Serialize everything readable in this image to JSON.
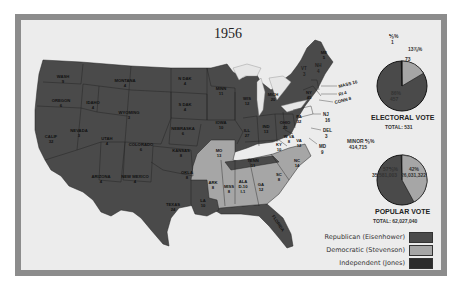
{
  "title": "1956",
  "colors": {
    "republican": "#4a4a4a",
    "democratic": "#a6a6a6",
    "independent": "#2b2b2b",
    "frame": "#8c8c8c",
    "paper": "#ececec"
  },
  "states": [
    {
      "name": "WASH",
      "ev": "9",
      "party": "R"
    },
    {
      "name": "OREGON",
      "ev": "6",
      "party": "R"
    },
    {
      "name": "CALIF",
      "ev": "32",
      "party": "R"
    },
    {
      "name": "IDAHO",
      "ev": "4",
      "party": "R"
    },
    {
      "name": "NEVADA",
      "ev": "3",
      "party": "R"
    },
    {
      "name": "MONTANA",
      "ev": "4",
      "party": "R"
    },
    {
      "name": "WYOMING",
      "ev": "3",
      "party": "R"
    },
    {
      "name": "UTAH",
      "ev": "4",
      "party": "R"
    },
    {
      "name": "ARIZONA",
      "ev": "4",
      "party": "R"
    },
    {
      "name": "COLORADO",
      "ev": "6",
      "party": "R"
    },
    {
      "name": "NEW MEXICO",
      "ev": "4",
      "party": "R"
    },
    {
      "name": "N DAK",
      "ev": "4",
      "party": "R"
    },
    {
      "name": "S DAK",
      "ev": "4",
      "party": "R"
    },
    {
      "name": "NEBRASKA",
      "ev": "6",
      "party": "R"
    },
    {
      "name": "KANSAS",
      "ev": "8",
      "party": "R"
    },
    {
      "name": "OKLA",
      "ev": "8",
      "party": "R"
    },
    {
      "name": "TEXAS",
      "ev": "24",
      "party": "R"
    },
    {
      "name": "MINN",
      "ev": "11",
      "party": "R"
    },
    {
      "name": "IOWA",
      "ev": "10",
      "party": "R"
    },
    {
      "name": "MO",
      "ev": "13",
      "party": "D"
    },
    {
      "name": "ARK",
      "ev": "8",
      "party": "D"
    },
    {
      "name": "LA",
      "ev": "10",
      "party": "R"
    },
    {
      "name": "WIS",
      "ev": "12",
      "party": "R"
    },
    {
      "name": "ILL",
      "ev": "27",
      "party": "R"
    },
    {
      "name": "MICH",
      "ev": "20",
      "party": "R"
    },
    {
      "name": "IND",
      "ev": "13",
      "party": "R"
    },
    {
      "name": "OHIO",
      "ev": "25",
      "party": "R"
    },
    {
      "name": "KY",
      "ev": "10",
      "party": "R"
    },
    {
      "name": "TENN",
      "ev": "11",
      "party": "R"
    },
    {
      "name": "MISS",
      "ev": "8",
      "party": "D"
    },
    {
      "name": "ALA",
      "ev": "D-10 I-1",
      "party": "D"
    },
    {
      "name": "GA",
      "ev": "12",
      "party": "D"
    },
    {
      "name": "FLORIDA",
      "ev": "10",
      "party": "R"
    },
    {
      "name": "SC",
      "ev": "8",
      "party": "D"
    },
    {
      "name": "NC",
      "ev": "14",
      "party": "D"
    },
    {
      "name": "VA",
      "ev": "12",
      "party": "R"
    },
    {
      "name": "W VA",
      "ev": "8",
      "party": "R"
    },
    {
      "name": "PA",
      "ev": "32",
      "party": "R"
    },
    {
      "name": "NY",
      "ev": "45",
      "party": "R"
    },
    {
      "name": "VT",
      "ev": "3",
      "party": "R"
    },
    {
      "name": "NH",
      "ev": "4",
      "party": "R"
    },
    {
      "name": "ME",
      "ev": "5",
      "party": "R"
    },
    {
      "name": "MASS",
      "ev": "16",
      "party": "R"
    },
    {
      "name": "RI",
      "ev": "4",
      "party": "R"
    },
    {
      "name": "CONN",
      "ev": "8",
      "party": "R"
    },
    {
      "name": "NJ",
      "ev": "16",
      "party": "R"
    },
    {
      "name": "DEL",
      "ev": "3",
      "party": "R"
    },
    {
      "name": "MD",
      "ev": "9",
      "party": "R"
    }
  ],
  "labels": {
    "wash": "WASH",
    "wash_ev": "9",
    "oregon": "OREGON",
    "oregon_ev": "6",
    "calif": "CALIF",
    "calif_ev": "32",
    "idaho": "IDAHO",
    "idaho_ev": "4",
    "nevada": "NEVADA",
    "nevada_ev": "3",
    "montana": "MONTANA",
    "montana_ev": "4",
    "wyoming": "WYOMING",
    "wyoming_ev": "3",
    "utah": "UTAH",
    "utah_ev": "4",
    "arizona": "ARIZONA",
    "arizona_ev": "4",
    "colorado": "COLORADO",
    "colorado_ev": "6",
    "newmexico": "NEW MEXICO",
    "newmexico_ev": "4",
    "ndak": "N DAK",
    "ndak_ev": "4",
    "sdak": "S DAK",
    "sdak_ev": "4",
    "nebraska": "NEBRASKA",
    "nebraska_ev": "6",
    "kansas": "KANSAS",
    "kansas_ev": "8",
    "okla": "OKLA",
    "okla_ev": "8",
    "texas": "TEXAS",
    "texas_ev": "24",
    "minn": "MINN",
    "minn_ev": "11",
    "iowa": "IOWA",
    "iowa_ev": "10",
    "mo": "MO",
    "mo_ev": "13",
    "ark": "ARK",
    "ark_ev": "8",
    "la": "LA",
    "la_ev": "10",
    "wis": "WIS",
    "wis_ev": "12",
    "ill": "ILL",
    "ill_ev": "27",
    "mich": "MICH",
    "mich_ev": "20",
    "ind": "IND",
    "ind_ev": "13",
    "ohio": "OHIO",
    "ohio_ev": "25",
    "ky": "KY",
    "ky_ev": "10",
    "tenn": "TENN",
    "tenn_ev": "11",
    "miss": "MISS",
    "miss_ev": "8",
    "ala": "ALA",
    "ala_ev": "D-10",
    "ala_ev2": "I-1",
    "ga": "GA",
    "ga_ev": "12",
    "florida": "FLORIDA",
    "florida_ev": "10",
    "sc": "SC",
    "sc_ev": "8",
    "nc": "NC",
    "nc_ev": "14",
    "va": "VA",
    "va_ev": "12",
    "wva": "W VA",
    "wva_ev": "8",
    "pa": "PA",
    "pa_ev": "32",
    "ny": "NY",
    "ny_ev": "45",
    "vt": "VT",
    "vt_ev": "3",
    "nh": "NH",
    "nh_ev": "4",
    "me": "ME",
    "me_ev": "5",
    "mass": "MASS 16",
    "ri": "RI 4",
    "conn": "CONN 8",
    "nj": "NJ",
    "nj_ev": "16",
    "del": "DEL",
    "del_ev": "3",
    "md": "MD",
    "md_ev": "9"
  },
  "electoral_vote": {
    "title": "ELECTORAL VOTE",
    "total": "TOTAL: 531",
    "independent_pct": "⅕%",
    "independent_votes": "1",
    "democratic_pct": "13⅞%",
    "democratic_votes": "73",
    "republican_pct": "86%",
    "republican_votes": "457"
  },
  "popular_vote": {
    "title": "POPULAR VOTE",
    "total": "TOTAL: 62,027,040",
    "minor_label": "MINOR ⅗%",
    "minor_votes": "414,715",
    "democratic_pct": "42%",
    "democratic_votes": "26,031,322",
    "republican_pct": "57⅗%",
    "republican_votes": "35,581,003"
  },
  "legend": [
    {
      "label": "Republican (Eisenhower)",
      "color": "#4a4a4a"
    },
    {
      "label": "Democratic (Stevenson)",
      "color": "#a6a6a6"
    },
    {
      "label": "Independent (Jones)",
      "color": "#2b2b2b"
    }
  ]
}
